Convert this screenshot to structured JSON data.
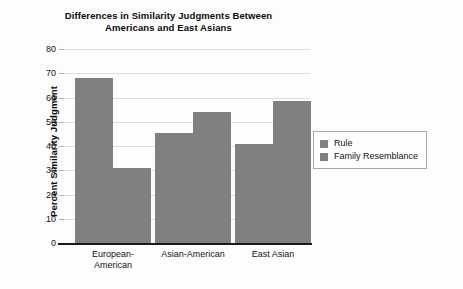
{
  "chart_data": {
    "type": "bar",
    "title": "Differences in Similarity Judgments Between Americans and East Asians",
    "title_lines": [
      "Differences in Similarity Judgments Between",
      "Americans and East Asians"
    ],
    "xlabel": "",
    "ylabel": "Percent Similarity Judgment",
    "ylim": [
      0,
      80
    ],
    "ytick_step": 10,
    "yticks": [
      80,
      70,
      60,
      50,
      40,
      30,
      20,
      10,
      0
    ],
    "ytick_labels": [
      "80",
      "70",
      "60",
      "50",
      "40",
      "30",
      "20",
      "10",
      "0"
    ],
    "categories": [
      "European-American",
      "Asian-American",
      "East Asian"
    ],
    "category_lines": [
      [
        "European-",
        "American"
      ],
      [
        "Asian-American"
      ],
      [
        "East Asian"
      ]
    ],
    "series": [
      {
        "name": "Rule",
        "values": [
          68,
          45.5,
          41
        ],
        "color": "#808080"
      },
      {
        "name": "Family Resemblance",
        "values": [
          31,
          54,
          58.5
        ],
        "color": "#808080"
      }
    ],
    "grid": true,
    "grid_color": "#dedede",
    "legend_position": "right",
    "bar_color": "#808080",
    "axis_color": "#1a1a1a",
    "background": "#fdfdfd"
  },
  "legend": {
    "entries": [
      {
        "label": "Rule",
        "color": "#808080"
      },
      {
        "label": "Family Resemblance",
        "color": "#808080"
      }
    ]
  }
}
